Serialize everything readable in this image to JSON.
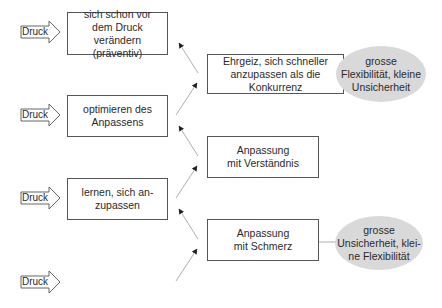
{
  "diagram": {
    "pressure_label": "Druck",
    "left_boxes": [
      {
        "text": "sich schon vor\ndem Druck verändern\n(präventiv)"
      },
      {
        "text": "optimieren des\nAnpassens"
      },
      {
        "text": "lernen, sich an-\nzupassen"
      }
    ],
    "right_boxes": [
      {
        "text": "Ehrgeiz, sich schneller\nanzupassen als die\nKonkurrenz"
      },
      {
        "text": "Anpassung\nmit Verständnis"
      },
      {
        "text": "Anpassung\nmit Schmerz"
      }
    ],
    "ellipses": [
      {
        "text": "grosse\nFlexibilität, kleine\nUnsicherheit"
      },
      {
        "text": "grosse\nUnsicherheit, klei-\nne Flexibilität"
      }
    ],
    "colors": {
      "ellipse_fill": "#d9d9d9",
      "box_border": "#555555",
      "arrow": "#888888",
      "arrowhead": "#222222"
    }
  }
}
